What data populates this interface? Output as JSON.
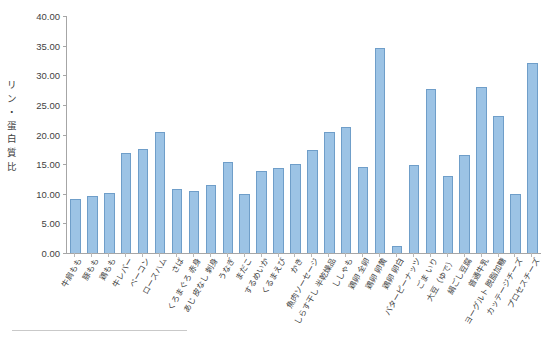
{
  "chart_data": {
    "type": "bar",
    "title": "",
    "subtitle": "",
    "xlabel": "",
    "ylabel": "リン・蛋白質比",
    "ylabel_chars": "リ\nン\n・\n蛋\n白\n質\n比",
    "ylim": [
      0,
      40
    ],
    "ytick_step": 5,
    "yticks": [
      "0.00",
      "5.00",
      "10.00",
      "15.00",
      "20.00",
      "25.00",
      "30.00",
      "35.00",
      "40.00"
    ],
    "ytick_values": [
      0,
      5,
      10,
      15,
      20,
      25,
      30,
      35,
      40
    ],
    "grid": false,
    "legend": "none",
    "bar_color": "#9cc3e5",
    "bar_border_color": "#6f9ec9",
    "axis_color": "#a6a6a6",
    "categories": [
      "牛肩もも",
      "豚もも",
      "鶏もも",
      "牛レバー",
      "ベーコン",
      "ロースハム",
      "さば",
      "くろまぐろ 赤身",
      "あじ 皮なし 刺身",
      "うなぎ",
      "まだこ",
      "するめいか",
      "くるまえび",
      "かき",
      "魚肉ソーセージ",
      "しらす干し 半乾燥品",
      "ししゃも",
      "鶏卵 全卵",
      "鶏卵 卵黄",
      "鶏卵 卵白",
      "バターピーナッツ",
      "ごま いり",
      "大豆（ゆで）",
      "絹ごし豆腐",
      "普通牛乳",
      "ヨーグルト 脱脂加糖",
      "カッテージチーズ",
      "プロセスチーズ"
    ],
    "values": [
      9.2,
      9.7,
      10.2,
      16.8,
      17.6,
      20.5,
      10.8,
      10.4,
      11.4,
      15.3,
      9.9,
      13.9,
      14.4,
      15.1,
      17.4,
      20.5,
      21.2,
      14.6,
      34.6,
      1.2,
      14.9,
      27.6,
      13.0,
      16.6,
      28.0,
      23.2,
      9.9,
      32.1
    ]
  }
}
